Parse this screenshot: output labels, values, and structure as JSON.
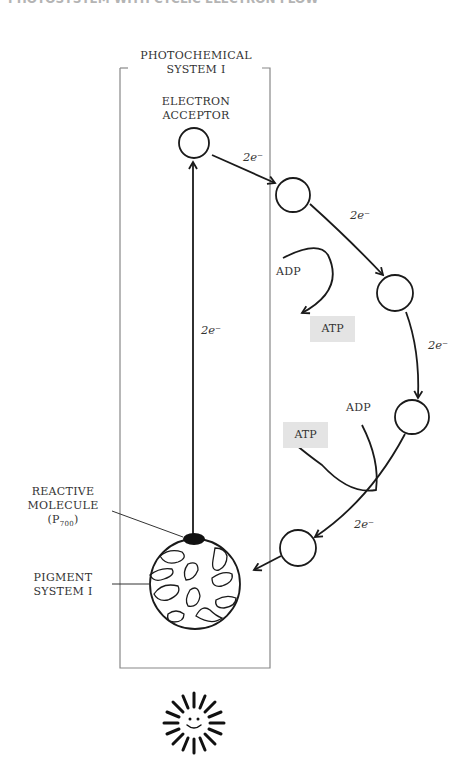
{
  "header_fragment": "PHOTOSYSTEM WITH CYCLIC ELECTRON FLOW",
  "box": {
    "title_line1": "PHOTOCHEMICAL",
    "title_line2": "SYSTEM I"
  },
  "labels": {
    "electron_acceptor_1": "ELECTRON",
    "electron_acceptor_2": "ACCEPTOR",
    "reactive_1": "REACTIVE",
    "reactive_2": "MOLECULE",
    "reactive_3": "(P",
    "reactive_sub": "700",
    "reactive_close": ")",
    "pigment_1": "PIGMENT",
    "pigment_2": "SYSTEM I"
  },
  "electron_labels": [
    "2e⁻",
    "2e⁻",
    "2e⁻",
    "2e⁻",
    "2e⁻"
  ],
  "adp_labels": [
    "ADP",
    "ADP"
  ],
  "atp_labels": [
    "ATP",
    "ATP"
  ],
  "colors": {
    "line": "#1a1a1a",
    "box": "#888888",
    "atp_bg": "#e4e4e4"
  }
}
